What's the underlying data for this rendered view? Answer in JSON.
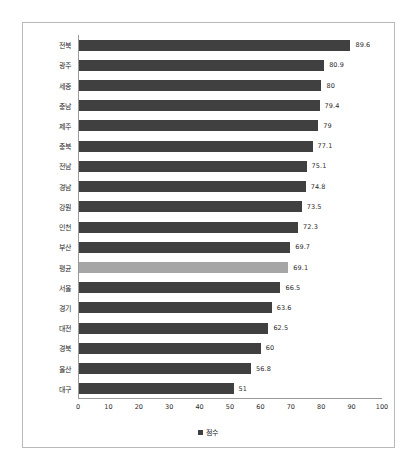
{
  "chart_data": {
    "type": "bar",
    "orientation": "horizontal",
    "title": "",
    "xlabel": "",
    "ylabel": "",
    "xlim": [
      0,
      100
    ],
    "xticks": [
      0,
      10,
      20,
      30,
      40,
      50,
      60,
      70,
      80,
      90,
      100
    ],
    "grid": false,
    "legend": {
      "position": "bottom",
      "entries": [
        {
          "label": "점수",
          "color": "#404040",
          "marker": "square"
        }
      ]
    },
    "series": [
      {
        "name": "점수",
        "color": "#404040",
        "highlight_color": "#a6a6a6"
      }
    ],
    "categories": [
      "전북",
      "광주",
      "세종",
      "충남",
      "제주",
      "충북",
      "전남",
      "경남",
      "강원",
      "인천",
      "부산",
      "평균",
      "서울",
      "경기",
      "대전",
      "경북",
      "울산",
      "대구"
    ],
    "values": [
      89.6,
      80.9,
      80,
      79.4,
      79,
      77.1,
      75.1,
      74.8,
      73.5,
      72.3,
      69.7,
      69.1,
      66.5,
      63.6,
      62.5,
      60,
      56.8,
      51
    ],
    "value_labels": [
      "89.6",
      "80.9",
      "80",
      "79.4",
      "79",
      "77.1",
      "75.1",
      "74.8",
      "73.5",
      "72.3",
      "69.7",
      "69.1",
      "66.5",
      "63.6",
      "62.5",
      "60",
      "56.8",
      "51"
    ],
    "highlighted_categories": [
      "평균"
    ]
  },
  "colors": {
    "bar": "#404040",
    "average_bar": "#a6a6a6",
    "axis": "#9a9a9a",
    "frame": "#b9b9b9",
    "background": "#ffffff",
    "text": "#1f1f1f"
  }
}
